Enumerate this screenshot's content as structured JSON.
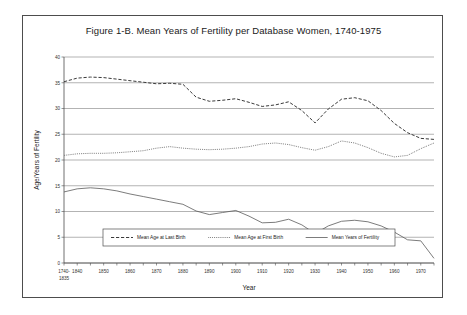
{
  "figure": {
    "title": "Figure 1-B.  Mean Years of Fertility per Database Women, 1740-1975"
  },
  "axes": {
    "ylabel": "Age/Years of Fertility",
    "xlabel": "Year",
    "yticks": [
      "0",
      "5",
      "10",
      "15",
      "20",
      "25",
      "30",
      "35",
      "40"
    ],
    "xticks": [
      "1740-\n1835",
      "1840",
      "1850",
      "1860",
      "1870",
      "1880",
      "1890",
      "1900",
      "1910",
      "1920",
      "1930",
      "1940",
      "1950",
      "1960",
      "1970"
    ],
    "first_xtick_line1": "1740-",
    "first_xtick_line2": "1835"
  },
  "legend": {
    "items": [
      {
        "label": "Mean Age at Last Birth",
        "style": "dashed",
        "color": "#3a3a3a"
      },
      {
        "label": "Mean Age at First Birth",
        "style": "dotted",
        "color": "#6b6b6b"
      },
      {
        "label": "Mean Years of Fertility",
        "style": "solid",
        "color": "#5a5a5a"
      }
    ]
  },
  "chart_data": {
    "type": "line",
    "title": "Figure 1-B.  Mean Years of Fertility per Database Women, 1740-1975",
    "xlabel": "Year",
    "ylabel": "Age/Years of Fertility",
    "xlim": [
      1835,
      1975
    ],
    "ylim": [
      0,
      40
    ],
    "grid": true,
    "legend_position": "bottom-center",
    "x": [
      1835,
      1840,
      1845,
      1850,
      1855,
      1860,
      1865,
      1870,
      1875,
      1880,
      1885,
      1890,
      1895,
      1900,
      1905,
      1910,
      1915,
      1920,
      1925,
      1930,
      1935,
      1940,
      1945,
      1950,
      1955,
      1960,
      1965,
      1970,
      1975
    ],
    "series": [
      {
        "name": "Mean Age at Last Birth",
        "style": "dashed",
        "values": [
          35.2,
          35.9,
          36.1,
          36.0,
          35.7,
          35.4,
          35.1,
          34.8,
          34.9,
          34.7,
          32.2,
          31.4,
          31.6,
          31.9,
          31.2,
          30.4,
          30.7,
          31.3,
          29.6,
          27.2,
          29.9,
          31.8,
          32.1,
          31.5,
          29.6,
          27.1,
          25.3,
          24.2,
          24.0
        ]
      },
      {
        "name": "Mean Age at First Birth",
        "style": "dotted",
        "values": [
          20.9,
          21.2,
          21.3,
          21.3,
          21.4,
          21.6,
          21.8,
          22.3,
          22.6,
          22.3,
          22.1,
          22.0,
          22.1,
          22.3,
          22.6,
          23.1,
          23.3,
          23.0,
          22.4,
          21.9,
          22.6,
          23.7,
          23.3,
          22.4,
          21.3,
          20.6,
          20.9,
          22.2,
          23.3
        ]
      },
      {
        "name": "Mean Years of Fertility",
        "style": "solid",
        "values": [
          13.8,
          14.4,
          14.6,
          14.4,
          14.0,
          13.4,
          12.9,
          12.4,
          11.9,
          11.4,
          10.1,
          9.4,
          9.8,
          10.2,
          9.1,
          7.8,
          7.9,
          8.5,
          7.4,
          5.7,
          7.2,
          8.1,
          8.3,
          8.0,
          7.2,
          6.0,
          4.5,
          4.3,
          0.9
        ]
      }
    ]
  }
}
